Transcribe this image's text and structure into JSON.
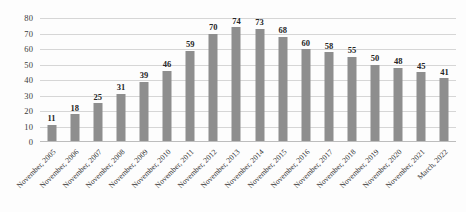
{
  "chart_data": {
    "type": "bar",
    "title": "",
    "subtitle": "",
    "xlabel": "",
    "ylabel": "",
    "ylim": [
      0,
      80
    ],
    "ytick_step": 10,
    "yticks": [
      "80",
      "70",
      "60",
      "50",
      "40",
      "30",
      "20",
      "10",
      "0"
    ],
    "grid": true,
    "legend": false,
    "legend_position": "none",
    "bar_color": "#8e8e8e",
    "gridline_color": "#d6d6d6",
    "background_color": "#fdfdfd",
    "label_color": "#262626",
    "categories": [
      "November, 2005",
      "November, 2006",
      "November, 2007",
      "November, 2008",
      "November, 2009",
      "November, 2010",
      "November, 2011",
      "November, 2012",
      "November, 2013",
      "November, 2014",
      "November, 2015",
      "November, 2016",
      "November, 2017",
      "November, 2018",
      "November, 2019",
      "November, 2020",
      "November, 2021",
      "March, 2022"
    ],
    "values": [
      11,
      18,
      25,
      31,
      39,
      46,
      59,
      70,
      74,
      73,
      68,
      60,
      58,
      55,
      50,
      48,
      45,
      41
    ],
    "data_labels": [
      "11",
      "18",
      "25",
      "31",
      "39",
      "46",
      "59",
      "70",
      "74",
      "73",
      "68",
      "60",
      "58",
      "55",
      "50",
      "48",
      "45",
      "41"
    ]
  }
}
